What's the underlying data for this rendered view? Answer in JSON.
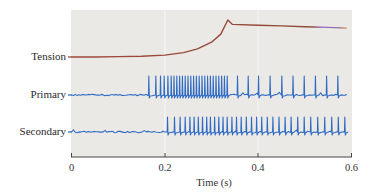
{
  "chart_data": {
    "type": "line",
    "title": "",
    "xlabel": "Time (s)",
    "ylabel": "",
    "xlim": [
      0,
      0.6
    ],
    "xticks": [
      0,
      0.2,
      0.4,
      0.6
    ],
    "xtick_labels": [
      "0",
      "0.2",
      "0.4",
      "0.6"
    ],
    "grid": false,
    "legend": "none (traces labeled at left)",
    "colors": {
      "plot_background": "#ebe9e6",
      "tension_start": "#a0483a",
      "tension_mid": "#9b6fd6",
      "tension_end": "#c79a4a",
      "spike_trace": "#2f6bc4",
      "axis": "#444444"
    },
    "series": [
      {
        "name": "Tension",
        "kind": "continuous",
        "points": [
          [
            0.0,
            0.0
          ],
          [
            0.05,
            0.0
          ],
          [
            0.1,
            0.01
          ],
          [
            0.15,
            0.02
          ],
          [
            0.2,
            0.05
          ],
          [
            0.24,
            0.12
          ],
          [
            0.27,
            0.22
          ],
          [
            0.3,
            0.4
          ],
          [
            0.32,
            0.62
          ],
          [
            0.335,
            1.0
          ],
          [
            0.345,
            0.88
          ],
          [
            0.4,
            0.86
          ],
          [
            0.45,
            0.84
          ],
          [
            0.5,
            0.82
          ],
          [
            0.55,
            0.8
          ],
          [
            0.59,
            0.78
          ]
        ]
      },
      {
        "name": "Primary",
        "kind": "spike_train",
        "spike_times": [
          0.165,
          0.18,
          0.19,
          0.198,
          0.206,
          0.213,
          0.219,
          0.225,
          0.231,
          0.237,
          0.243,
          0.249,
          0.255,
          0.261,
          0.267,
          0.273,
          0.279,
          0.285,
          0.291,
          0.297,
          0.303,
          0.309,
          0.315,
          0.321,
          0.327,
          0.333,
          0.355,
          0.378,
          0.4,
          0.425,
          0.45,
          0.474,
          0.498,
          0.522,
          0.546,
          0.57
        ]
      },
      {
        "name": "Secondary",
        "kind": "spike_train",
        "spike_times": [
          0.205,
          0.22,
          0.232,
          0.243,
          0.253,
          0.262,
          0.271,
          0.28,
          0.289,
          0.297,
          0.306,
          0.315,
          0.324,
          0.333,
          0.343,
          0.353,
          0.363,
          0.374,
          0.385,
          0.396,
          0.407,
          0.419,
          0.431,
          0.444,
          0.457,
          0.47,
          0.484,
          0.498,
          0.512,
          0.527,
          0.542,
          0.557,
          0.571,
          0.585
        ]
      }
    ]
  },
  "labels": {
    "tension": "Tension",
    "primary": "Primary",
    "secondary": "Secondary",
    "xlabel": "Time (s)",
    "ticks": [
      "0",
      "0.2",
      "0.4",
      "0.6"
    ]
  }
}
